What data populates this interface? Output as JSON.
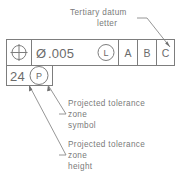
{
  "diagram": {
    "colors": {
      "line": "#7d7d7d",
      "text": "#6f6f6f",
      "background": "#ffffff"
    }
  },
  "annotations": {
    "top": {
      "line1": "Tertiary  datum",
      "line2": "letter",
      "target": "datum-c-cell"
    },
    "middle": {
      "line1": "Projected  tolerance",
      "line2": "zone",
      "line3": "symbol",
      "target": "projected-tolerance-symbol"
    },
    "bottom": {
      "line1": "Projected  tolerance",
      "line2": "zone",
      "line3": "height",
      "target": "projected-tolerance-height"
    }
  },
  "feature_control_frame": {
    "cells": [
      {
        "name": "geometric-characteristic",
        "icon": "position-symbol",
        "value": ""
      },
      {
        "name": "tolerance-value",
        "diameter_symbol": "Ø",
        "value": ".005",
        "modifier": "L",
        "modifier_meaning": "least-material-condition"
      },
      {
        "name": "primary-datum",
        "value": "A"
      },
      {
        "name": "secondary-datum",
        "value": "B"
      },
      {
        "name": "tertiary-datum",
        "value": "C"
      }
    ]
  },
  "projected_tolerance": {
    "height": "24",
    "symbol": "P",
    "symbol_meaning": "projected-tolerance-zone"
  }
}
